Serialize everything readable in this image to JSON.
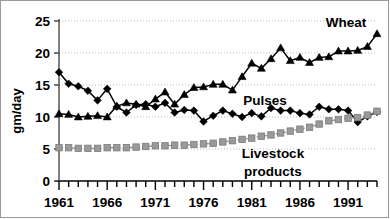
{
  "chart_data": {
    "type": "line",
    "title": "",
    "xlabel": "",
    "ylabel": "gm/day",
    "xlim": [
      1961,
      1994
    ],
    "ylim": [
      0,
      25
    ],
    "yticks": [
      0,
      5,
      10,
      15,
      20,
      25
    ],
    "xticks": [
      1961,
      1966,
      1971,
      1976,
      1981,
      1986,
      1991
    ],
    "xtick_labels": [
      "1961",
      "1966",
      "1971",
      "1976",
      "1981",
      "1986",
      "1991"
    ],
    "ytick_labels": [
      "0",
      "5",
      "10",
      "15",
      "20",
      "25"
    ],
    "grid": "horizontal-dotted",
    "legend_position": "inline-annotations",
    "x": [
      1961,
      1962,
      1963,
      1964,
      1965,
      1966,
      1967,
      1968,
      1969,
      1970,
      1971,
      1972,
      1973,
      1974,
      1975,
      1976,
      1977,
      1978,
      1979,
      1980,
      1981,
      1982,
      1983,
      1984,
      1985,
      1986,
      1987,
      1988,
      1989,
      1990,
      1991,
      1992,
      1993,
      1994
    ],
    "series": [
      {
        "name": "Wheat",
        "marker": "triangle",
        "color": "#000000",
        "linestyle": "solid",
        "label_text": "Wheat",
        "values": [
          10.5,
          10.4,
          10.0,
          10.1,
          10.2,
          10.0,
          11.7,
          12.2,
          12.0,
          11.6,
          12.8,
          13.9,
          12.0,
          13.5,
          14.6,
          14.7,
          15.1,
          15.1,
          14.2,
          16.3,
          18.4,
          17.6,
          19.1,
          20.8,
          18.8,
          19.3,
          18.5,
          19.3,
          19.4,
          20.3,
          20.3,
          20.4,
          21.0,
          23.0
        ]
      },
      {
        "name": "Pulses",
        "marker": "diamond",
        "color": "#000000",
        "linestyle": "solid",
        "label_text": "Pulses",
        "values": [
          17.0,
          15.2,
          14.8,
          14.1,
          12.6,
          14.4,
          11.6,
          10.7,
          11.9,
          12.0,
          11.6,
          12.2,
          10.7,
          11.1,
          11.0,
          9.3,
          10.2,
          11.0,
          10.5,
          10.0,
          10.6,
          10.1,
          11.4,
          11.0,
          11.0,
          10.6,
          10.4,
          11.6,
          11.2,
          11.2,
          11.0,
          9.2,
          10.1,
          10.8
        ]
      },
      {
        "name": "Livestock products",
        "marker": "square",
        "color": "#9a9a9a",
        "linestyle": "dashed",
        "label_text": "Livestock products",
        "label_line1": "Livestock",
        "label_line2": "products",
        "values": [
          5.2,
          5.2,
          5.1,
          5.1,
          5.1,
          5.2,
          5.2,
          5.2,
          5.3,
          5.4,
          5.5,
          5.5,
          5.6,
          5.6,
          5.7,
          5.8,
          5.9,
          6.1,
          6.3,
          6.5,
          6.7,
          7.0,
          7.2,
          7.5,
          7.8,
          8.1,
          8.4,
          8.9,
          9.4,
          9.6,
          9.8,
          9.9,
          10.3,
          10.9
        ]
      }
    ]
  },
  "axis": {
    "y_title": "gm/day"
  }
}
